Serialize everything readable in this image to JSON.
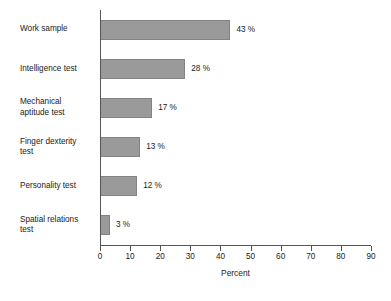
{
  "chart_data": {
    "type": "bar",
    "orientation": "horizontal",
    "title": "",
    "subtitle": "",
    "xlabel": "Percent",
    "ylabel": "",
    "xlim": [
      0,
      90
    ],
    "xticks": [
      0,
      10,
      20,
      30,
      40,
      50,
      60,
      70,
      80,
      90
    ],
    "xtick_labels": [
      "0",
      "10",
      "20",
      "30",
      "40",
      "50",
      "60",
      "70",
      "80",
      "90"
    ],
    "grid": false,
    "legend": null,
    "bar_color": "#9a9a9a",
    "bar_edge_color": "#838383",
    "axis_color": "#555555",
    "background": "#ffffff",
    "categories": [
      "Work sample",
      "Intelligence test",
      "Mechanical\naptitude test",
      "Finger dexterity\ntest",
      "Personality test",
      "Spatial relations\ntest"
    ],
    "values": [
      43,
      28,
      17,
      13,
      12,
      3
    ],
    "value_labels": [
      "43 %",
      "28 %",
      "17 %",
      "13 %",
      "12 %",
      "3 %"
    ]
  }
}
